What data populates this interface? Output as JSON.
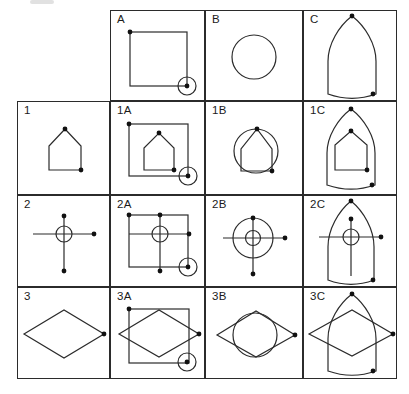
{
  "diagram": {
    "colors": {
      "line": "#2b2b2b",
      "dot": "#111111",
      "background": "#ffffff",
      "label": "#1b1b1b"
    },
    "grid": {
      "col_edges": [
        17,
        110,
        205,
        303,
        397
      ],
      "row_edges": [
        10,
        101,
        195,
        287,
        379
      ],
      "empty_corner": "top-left"
    },
    "column_headers": [
      "A",
      "B",
      "C"
    ],
    "row_headers": [
      "1",
      "2",
      "3"
    ],
    "cells": [
      {
        "label": "A",
        "col": 1,
        "row": 0,
        "shapes": [
          {
            "type": "rect",
            "name": "square",
            "x": 19,
            "y": 21,
            "w": 57,
            "h": 54
          },
          {
            "type": "dot",
            "name": "corner-dot",
            "cx": 19,
            "cy": 21
          },
          {
            "type": "dotcircle",
            "name": "ring-marker",
            "cx": 76,
            "cy": 75,
            "r": 9
          }
        ]
      },
      {
        "label": "B",
        "col": 2,
        "row": 0,
        "shapes": [
          {
            "type": "circle",
            "name": "circle",
            "cx": 48,
            "cy": 46,
            "r": 22
          }
        ]
      },
      {
        "label": "C",
        "col": 3,
        "row": 0,
        "shapes": [
          {
            "type": "arch",
            "name": "arch",
            "ax": 48,
            "ay": 5,
            "hw": 24,
            "h": 78
          },
          {
            "type": "dot",
            "name": "apex-dot",
            "cx": 48,
            "cy": 5
          },
          {
            "type": "dot",
            "name": "corner-dot",
            "cx": 69,
            "cy": 83
          }
        ]
      },
      {
        "label": "1",
        "col": 0,
        "row": 1,
        "shapes": [
          {
            "type": "polygon",
            "name": "house",
            "points": "31,68 31,44 47,27 63,44 63,68"
          },
          {
            "type": "dot",
            "name": "apex-dot",
            "cx": 47,
            "cy": 27
          },
          {
            "type": "dot",
            "name": "corner-dot",
            "cx": 63,
            "cy": 68
          }
        ]
      },
      {
        "label": "1A",
        "col": 1,
        "row": 1,
        "shapes": [
          {
            "type": "rect",
            "name": "square",
            "x": 18,
            "y": 22,
            "w": 59,
            "h": 52
          },
          {
            "type": "dot",
            "name": "corner-dot",
            "cx": 18,
            "cy": 22
          },
          {
            "type": "polygon",
            "name": "house",
            "points": "33,68 33,46 48,31 63,46 63,68"
          },
          {
            "type": "dot",
            "name": "apex-dot",
            "cx": 48,
            "cy": 31
          },
          {
            "type": "dot",
            "name": "corner-dot",
            "cx": 63,
            "cy": 68
          },
          {
            "type": "dotcircle",
            "name": "ring-marker",
            "cx": 77,
            "cy": 74,
            "r": 9
          }
        ]
      },
      {
        "label": "1B",
        "col": 2,
        "row": 1,
        "shapes": [
          {
            "type": "circle",
            "name": "circle",
            "cx": 50,
            "cy": 49,
            "r": 22
          },
          {
            "type": "polygon",
            "name": "house",
            "points": "35,69 35,47 51,27 66,47 66,69"
          },
          {
            "type": "dot",
            "name": "apex-dot",
            "cx": 51,
            "cy": 27
          },
          {
            "type": "dot",
            "name": "corner-dot",
            "cx": 66,
            "cy": 69
          }
        ]
      },
      {
        "label": "1C",
        "col": 3,
        "row": 1,
        "shapes": [
          {
            "type": "arch",
            "name": "arch",
            "ax": 47,
            "ay": 7,
            "hw": 24,
            "h": 76
          },
          {
            "type": "dot",
            "name": "apex-dot",
            "cx": 47,
            "cy": 7
          },
          {
            "type": "dot",
            "name": "corner-dot",
            "cx": 68,
            "cy": 83
          },
          {
            "type": "polygon",
            "name": "house",
            "points": "31,68 31,43 47,29 63,43 63,68"
          },
          {
            "type": "dot",
            "name": "apex-dot",
            "cx": 47,
            "cy": 29
          },
          {
            "type": "dot",
            "name": "corner-dot",
            "cx": 63,
            "cy": 68
          }
        ]
      },
      {
        "label": "2",
        "col": 0,
        "row": 2,
        "shapes": [
          {
            "type": "line",
            "name": "cross-vertical-line",
            "x1": 46,
            "y1": 20,
            "x2": 46,
            "y2": 75
          },
          {
            "type": "line",
            "name": "cross-horizontal-line",
            "x1": 15,
            "y1": 38,
            "x2": 76,
            "y2": 38
          },
          {
            "type": "circle",
            "name": "cross-ring",
            "cx": 46,
            "cy": 38,
            "r": 8
          },
          {
            "type": "dot",
            "name": "end-dot",
            "cx": 46,
            "cy": 20
          },
          {
            "type": "dot",
            "name": "end-dot",
            "cx": 46,
            "cy": 75
          },
          {
            "type": "dot",
            "name": "end-dot",
            "cx": 76,
            "cy": 38
          }
        ]
      },
      {
        "label": "2A",
        "col": 1,
        "row": 2,
        "shapes": [
          {
            "type": "rect",
            "name": "square",
            "x": 18,
            "y": 19,
            "w": 59,
            "h": 52
          },
          {
            "type": "dot",
            "name": "corner-dot",
            "cx": 18,
            "cy": 19
          },
          {
            "type": "line",
            "name": "cross-vertical-line",
            "x1": 49,
            "y1": 19,
            "x2": 49,
            "y2": 75
          },
          {
            "type": "line",
            "name": "cross-horizontal-line",
            "x1": 18,
            "y1": 38,
            "x2": 78,
            "y2": 38
          },
          {
            "type": "circle",
            "name": "cross-ring",
            "cx": 49,
            "cy": 38,
            "r": 8
          },
          {
            "type": "dot",
            "name": "end-dot",
            "cx": 49,
            "cy": 19
          },
          {
            "type": "dot",
            "name": "end-dot",
            "cx": 49,
            "cy": 75
          },
          {
            "type": "dot",
            "name": "end-dot",
            "cx": 78,
            "cy": 38
          },
          {
            "type": "dotcircle",
            "name": "ring-marker",
            "cx": 77,
            "cy": 71,
            "r": 9
          }
        ]
      },
      {
        "label": "2B",
        "col": 2,
        "row": 2,
        "shapes": [
          {
            "type": "circle",
            "name": "circle",
            "cx": 47,
            "cy": 42,
            "r": 20
          },
          {
            "type": "line",
            "name": "cross-vertical-line",
            "x1": 47,
            "y1": 22,
            "x2": 47,
            "y2": 78
          },
          {
            "type": "line",
            "name": "cross-horizontal-line",
            "x1": 17,
            "y1": 42,
            "x2": 79,
            "y2": 42
          },
          {
            "type": "circle",
            "name": "cross-ring",
            "cx": 47,
            "cy": 42,
            "r": 7.5
          },
          {
            "type": "dot",
            "name": "end-dot",
            "cx": 47,
            "cy": 22
          },
          {
            "type": "dot",
            "name": "end-dot",
            "cx": 47,
            "cy": 78
          },
          {
            "type": "dot",
            "name": "end-dot",
            "cx": 79,
            "cy": 42
          }
        ]
      },
      {
        "label": "2C",
        "col": 3,
        "row": 2,
        "shapes": [
          {
            "type": "arch",
            "name": "arch",
            "ax": 47,
            "ay": 5,
            "hw": 23,
            "h": 79
          },
          {
            "type": "dot",
            "name": "apex-dot",
            "cx": 47,
            "cy": 5
          },
          {
            "type": "dot",
            "name": "corner-dot",
            "cx": 69,
            "cy": 84
          },
          {
            "type": "line",
            "name": "cross-vertical-line",
            "x1": 47,
            "y1": 23,
            "x2": 47,
            "y2": 80
          },
          {
            "type": "line",
            "name": "cross-horizontal-line",
            "x1": 15,
            "y1": 41,
            "x2": 77,
            "y2": 41
          },
          {
            "type": "circle",
            "name": "cross-ring",
            "cx": 47,
            "cy": 41,
            "r": 8
          },
          {
            "type": "dot",
            "name": "end-dot",
            "cx": 47,
            "cy": 23
          },
          {
            "type": "dot",
            "name": "end-dot",
            "cx": 77,
            "cy": 41
          }
        ]
      },
      {
        "label": "3",
        "col": 0,
        "row": 3,
        "shapes": [
          {
            "type": "polygon",
            "name": "diamond",
            "points": "6,46 46,22 86,46 46,70"
          },
          {
            "type": "dot",
            "name": "vertex-dot",
            "cx": 86,
            "cy": 46
          }
        ]
      },
      {
        "label": "3A",
        "col": 1,
        "row": 3,
        "shapes": [
          {
            "type": "rect",
            "name": "square",
            "x": 18,
            "y": 21,
            "w": 60,
            "h": 54
          },
          {
            "type": "dot",
            "name": "corner-dot",
            "cx": 18,
            "cy": 21
          },
          {
            "type": "polygon",
            "name": "diamond",
            "points": "8,46 48,22 88,46 48,69"
          },
          {
            "type": "dot",
            "name": "vertex-dot",
            "cx": 88,
            "cy": 46
          },
          {
            "type": "dotcircle",
            "name": "ring-marker",
            "cx": 76,
            "cy": 74,
            "r": 9
          }
        ]
      },
      {
        "label": "3B",
        "col": 2,
        "row": 3,
        "shapes": [
          {
            "type": "circle",
            "name": "circle",
            "cx": 49,
            "cy": 47,
            "r": 22
          },
          {
            "type": "polygon",
            "name": "diamond",
            "points": "11,47 50,23 89,47 50,69"
          },
          {
            "type": "dot",
            "name": "vertex-dot",
            "cx": 89,
            "cy": 47
          }
        ]
      },
      {
        "label": "3C",
        "col": 3,
        "row": 3,
        "shapes": [
          {
            "type": "arch",
            "name": "arch",
            "ax": 48,
            "ay": 6,
            "hw": 24,
            "h": 77
          },
          {
            "type": "dot",
            "name": "apex-dot",
            "cx": 48,
            "cy": 6
          },
          {
            "type": "dot",
            "name": "corner-dot",
            "cx": 69,
            "cy": 83
          },
          {
            "type": "polygon",
            "name": "diamond",
            "points": "5,46 48,22 89,46 48,68"
          },
          {
            "type": "dot",
            "name": "vertex-dot",
            "cx": 89,
            "cy": 46
          }
        ]
      }
    ]
  }
}
